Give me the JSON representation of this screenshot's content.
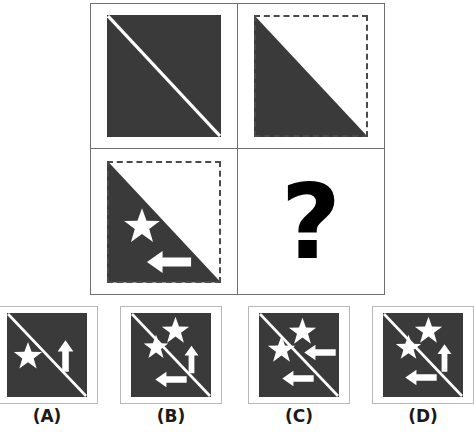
{
  "puzzle": {
    "type": "visual-analogy-matrix",
    "question_mark": "?",
    "colors": {
      "dark_fill": "#3a3a3a",
      "shape_white": "#ffffff",
      "grid_line": "#6f6f6f",
      "option_border": "#b9b9b9",
      "label_text": "#1a1a1a",
      "background": "#ffffff"
    },
    "matrix": {
      "rows": 2,
      "cols": 2,
      "cells": [
        {
          "position": "row1-col1",
          "name": "matrix-cell-1-1",
          "fill": "full-dark-square",
          "outline": "none",
          "diagonal_line": "white-line-topleft-to-bottomright",
          "shapes": []
        },
        {
          "position": "row1-col2",
          "name": "matrix-cell-1-2",
          "fill": "lower-left-triangle-dark",
          "outline": "dashed-square",
          "diagonal_line": "none",
          "shapes": []
        },
        {
          "position": "row2-col1",
          "name": "matrix-cell-2-1",
          "fill": "lower-left-triangle-dark",
          "outline": "dashed-square",
          "diagonal_line": "none",
          "shapes": [
            {
              "icon": "star-icon",
              "fill": "white",
              "where": "upper-left-of-triangle"
            },
            {
              "icon": "arrow-left-icon",
              "fill": "white",
              "where": "lower-middle-of-triangle"
            }
          ]
        },
        {
          "position": "row2-col2",
          "name": "matrix-cell-2-2",
          "fill": "none",
          "outline": "none",
          "diagonal_line": "none",
          "shapes": [],
          "content": "question-mark"
        }
      ]
    },
    "options": [
      {
        "id": "A",
        "label": "(A)",
        "fill": "full-dark-square",
        "diagonal_line": "white-line-topleft-to-bottomright",
        "shapes": [
          {
            "icon": "star-icon",
            "fill": "white",
            "where": "left-below-diagonal"
          },
          {
            "icon": "arrow-up-icon",
            "fill": "white",
            "where": "right-above-diagonal"
          }
        ]
      },
      {
        "id": "B",
        "label": "(B)",
        "fill": "full-dark-square",
        "diagonal_line": "white-line-topleft-to-bottomright",
        "shapes": [
          {
            "icon": "star-icon",
            "fill": "white",
            "where": "top-center-above-diagonal"
          },
          {
            "icon": "star-icon",
            "fill": "white",
            "where": "left-below-diagonal"
          },
          {
            "icon": "arrow-up-icon",
            "fill": "white",
            "where": "right-above-diagonal"
          },
          {
            "icon": "arrow-left-icon",
            "fill": "white",
            "where": "bottom-center-below-diagonal"
          }
        ]
      },
      {
        "id": "C",
        "label": "(C)",
        "fill": "full-dark-square",
        "diagonal_line": "white-line-topleft-to-bottomright",
        "shapes": [
          {
            "icon": "star-icon",
            "fill": "white",
            "where": "top-center-above-diagonal"
          },
          {
            "icon": "star-icon",
            "fill": "white",
            "where": "left-below-diagonal"
          },
          {
            "icon": "arrow-left-icon",
            "fill": "white",
            "where": "middle-right-above-diagonal"
          },
          {
            "icon": "arrow-left-icon",
            "fill": "white",
            "where": "bottom-center-below-diagonal"
          }
        ]
      },
      {
        "id": "D",
        "label": "(D)",
        "fill": "full-dark-square",
        "diagonal_line": "white-line-topleft-to-bottomright",
        "shapes": [
          {
            "icon": "star-icon",
            "fill": "white",
            "where": "top-center-above-diagonal"
          },
          {
            "icon": "star-icon",
            "fill": "white",
            "where": "left-below-diagonal"
          },
          {
            "icon": "arrow-up-icon",
            "fill": "white",
            "where": "right-above-diagonal"
          },
          {
            "icon": "arrow-left-icon",
            "fill": "white",
            "where": "bottom-center-below-diagonal"
          }
        ]
      }
    ]
  }
}
